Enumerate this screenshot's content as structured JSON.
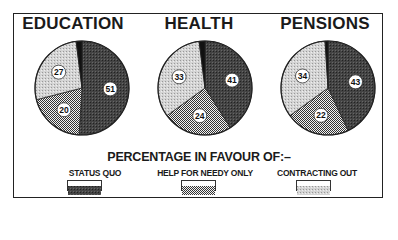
{
  "chart_data": [
    {
      "type": "pie",
      "title": "EDUCATION",
      "labels": [
        "Status quo",
        "Help for needy only",
        "Contracting out",
        "Other / don't know"
      ],
      "values": [
        51,
        20,
        27,
        2
      ],
      "data_labels": [
        "51",
        "20",
        "27"
      ]
    },
    {
      "type": "pie",
      "title": "HEALTH",
      "labels": [
        "Status quo",
        "Help for needy only",
        "Contracting out",
        "Other / don't know"
      ],
      "values": [
        41,
        24,
        33,
        2
      ],
      "data_labels": [
        "41",
        "24",
        "33"
      ]
    },
    {
      "type": "pie",
      "title": "PENSIONS",
      "labels": [
        "Status quo",
        "Help for needy only",
        "Contracting out",
        "Other / don't know"
      ],
      "values": [
        43,
        22,
        34,
        1
      ],
      "data_labels": [
        "43",
        "22",
        "34"
      ]
    }
  ],
  "caption": "PERCENTAGE IN FAVOUR OF:–",
  "legend": [
    {
      "label": "STATUS QUO",
      "pattern": "dark-crosshatch",
      "color": "#3a3a3a"
    },
    {
      "label": "HELP FOR NEEDY ONLY",
      "pattern": "checker-dots",
      "color": "#9a9a9a"
    },
    {
      "label": "CONTRACTING OUT",
      "pattern": "light-stipple",
      "color": "#c9c9c9"
    }
  ],
  "titles": [
    "EDUCATION",
    "HEALTH",
    "PENSIONS"
  ]
}
